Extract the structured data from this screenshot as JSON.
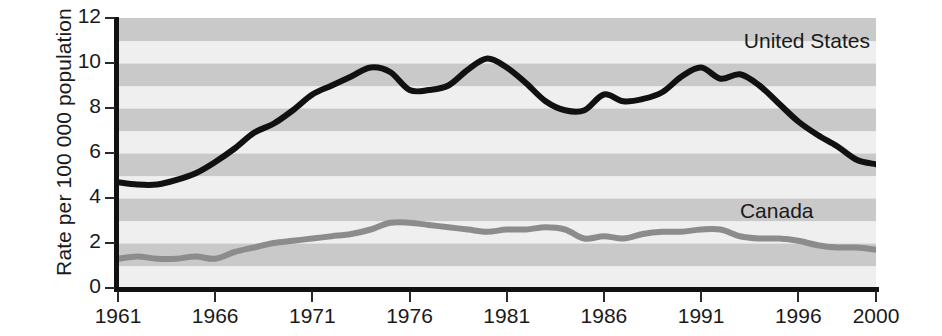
{
  "chart_data": {
    "type": "line",
    "title": "",
    "subtitle": "",
    "xlabel": "",
    "ylabel": "Rate per 100 000 population",
    "xlim": [
      1961,
      2000
    ],
    "ylim": [
      0,
      12
    ],
    "grid": "horizontal-alternating-bands",
    "band_step": 1,
    "legend_position": "inline-annotations",
    "y_ticks": [
      "0",
      "2",
      "4",
      "6",
      "8",
      "10",
      "12"
    ],
    "y_tick_values": [
      0,
      2,
      4,
      6,
      8,
      10,
      12
    ],
    "x_ticks": [
      "1961",
      "1966",
      "1971",
      "1976",
      "1981",
      "1986",
      "1991",
      "1996",
      "2000"
    ],
    "x_tick_values": [
      1961,
      1966,
      1971,
      1976,
      1981,
      1986,
      1991,
      1996,
      2000
    ],
    "x": [
      1961,
      1962,
      1963,
      1964,
      1965,
      1966,
      1967,
      1968,
      1969,
      1970,
      1971,
      1972,
      1973,
      1974,
      1975,
      1976,
      1977,
      1978,
      1979,
      1980,
      1981,
      1982,
      1983,
      1984,
      1985,
      1986,
      1987,
      1988,
      1989,
      1990,
      1991,
      1992,
      1993,
      1994,
      1995,
      1996,
      1997,
      1998,
      1999,
      2000
    ],
    "series": [
      {
        "name": "United States",
        "color": "#111111",
        "width": 6,
        "values": [
          4.7,
          4.6,
          4.6,
          4.8,
          5.1,
          5.6,
          6.2,
          6.9,
          7.3,
          7.9,
          8.6,
          9.0,
          9.4,
          9.8,
          9.6,
          8.8,
          8.8,
          9.0,
          9.7,
          10.2,
          9.8,
          9.1,
          8.3,
          7.9,
          7.9,
          8.6,
          8.3,
          8.4,
          8.7,
          9.4,
          9.8,
          9.3,
          9.5,
          9.0,
          8.2,
          7.4,
          6.8,
          6.3,
          5.7,
          5.5
        ]
      },
      {
        "name": "Canada",
        "color": "#8c8c8c",
        "width": 6,
        "values": [
          1.3,
          1.4,
          1.3,
          1.3,
          1.4,
          1.3,
          1.6,
          1.8,
          2.0,
          2.1,
          2.2,
          2.3,
          2.4,
          2.6,
          2.9,
          2.9,
          2.8,
          2.7,
          2.6,
          2.5,
          2.6,
          2.6,
          2.7,
          2.6,
          2.2,
          2.3,
          2.2,
          2.4,
          2.5,
          2.5,
          2.6,
          2.6,
          2.3,
          2.2,
          2.2,
          2.1,
          1.9,
          1.8,
          1.8,
          1.7
        ]
      }
    ],
    "annotations": [
      {
        "text": "United States",
        "x": 1993.2,
        "y": 10.9
      },
      {
        "text": "Canada",
        "x": 1993.0,
        "y": 3.35
      }
    ],
    "band_colors": {
      "light": "#efefef",
      "dark": "#c9c9c9"
    },
    "axis_color": "#111111"
  }
}
